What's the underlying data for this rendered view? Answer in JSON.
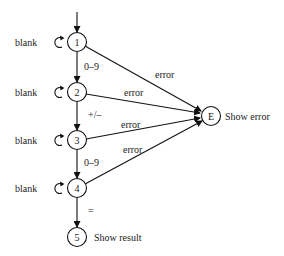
{
  "diagram": {
    "type": "state-transition",
    "nodes": [
      {
        "id": "1",
        "label": "1",
        "self_loop": "blank"
      },
      {
        "id": "2",
        "label": "2",
        "self_loop": "blank"
      },
      {
        "id": "3",
        "label": "3",
        "self_loop": "blank"
      },
      {
        "id": "4",
        "label": "4",
        "self_loop": "blank"
      },
      {
        "id": "5",
        "label": "5",
        "caption": "Show result"
      },
      {
        "id": "E",
        "label": "E",
        "caption": "Show error"
      }
    ],
    "edges": [
      {
        "from": "start",
        "to": "1",
        "label": ""
      },
      {
        "from": "1",
        "to": "2",
        "label": "0–9"
      },
      {
        "from": "2",
        "to": "3",
        "label": "+/–"
      },
      {
        "from": "3",
        "to": "4",
        "label": "0–9"
      },
      {
        "from": "4",
        "to": "5",
        "label": "="
      },
      {
        "from": "1",
        "to": "E",
        "label": "error"
      },
      {
        "from": "2",
        "to": "E",
        "label": "error"
      },
      {
        "from": "3",
        "to": "E",
        "label": "error"
      },
      {
        "from": "4",
        "to": "E",
        "label": "error"
      }
    ],
    "loop_label": "blank",
    "captions": {
      "result": "Show result",
      "error": "Show error"
    }
  }
}
